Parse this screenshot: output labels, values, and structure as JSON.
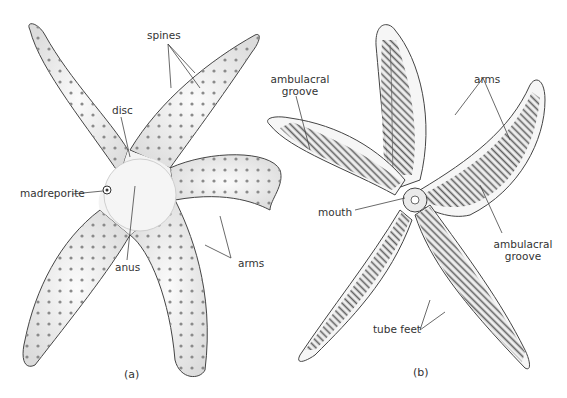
{
  "figure": {
    "panels": [
      {
        "id": "a",
        "caption": "(a)",
        "view": "aboral (top) surface",
        "labels": {
          "spines": "spines",
          "disc": "disc",
          "madreporite": "madreporite",
          "anus": "anus",
          "arms": "arms"
        }
      },
      {
        "id": "b",
        "caption": "(b)",
        "view": "oral (underside) surface",
        "labels": {
          "ambulacral_groove_top_line1": "ambulacral",
          "ambulacral_groove_top_line2": "groove",
          "arms": "arms",
          "mouth": "mouth",
          "ambulacral_groove_right_line1": "ambulacral",
          "ambulacral_groove_right_line2": "groove",
          "tube_feet": "tube feet"
        }
      }
    ],
    "colors": {
      "background": "#ffffff",
      "outline": "#444444",
      "body_fill": "#f1f1f1",
      "spine_dot": "#8a8a8a",
      "tube_feet": "#555555",
      "label_text": "#333333"
    }
  }
}
